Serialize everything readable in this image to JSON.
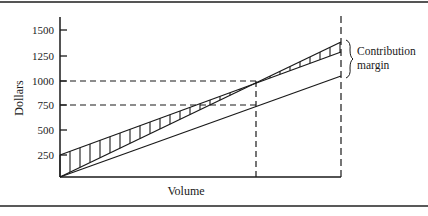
{
  "chart_data": {
    "type": "line",
    "title": "",
    "xlabel": "Volume",
    "ylabel": "Dollars",
    "y_ticks": [
      250,
      500,
      750,
      1000,
      1250,
      1500
    ],
    "y_tick_labels": [
      "250",
      "500",
      "750",
      "1000",
      "1250",
      "1500"
    ],
    "ylim": [
      0,
      1625
    ],
    "xlim": [
      0,
      1
    ],
    "grid": false,
    "legend": "none",
    "series": [
      {
        "name": "Total revenue",
        "style": "solid",
        "points": [
          [
            0,
            0
          ],
          [
            1,
            1400
          ]
        ]
      },
      {
        "name": "Total cost",
        "style": "solid",
        "points": [
          [
            0,
            250
          ],
          [
            1,
            1300
          ]
        ]
      },
      {
        "name": "Variable cost",
        "style": "solid",
        "points": [
          [
            0,
            0
          ],
          [
            1,
            1050
          ]
        ]
      }
    ],
    "shaded_region": {
      "between": [
        "Total revenue",
        "Variable cost"
      ],
      "pattern": "vertical hatching",
      "meaning": "Contribution margin"
    },
    "reference_lines": [
      {
        "type": "horizontal",
        "y": 1000,
        "style": "dashed",
        "x_to": 0.7
      },
      {
        "type": "horizontal",
        "y": 750,
        "style": "dashed",
        "x_to": 0.7
      },
      {
        "type": "vertical",
        "x": 0.7,
        "style": "dashed",
        "label": "break-even volume"
      },
      {
        "type": "vertical",
        "x": 1.0,
        "style": "dashed"
      }
    ],
    "annotations": [
      {
        "text": "Contribution margin",
        "lines": [
          "Contribution",
          "margin"
        ],
        "at_x": 1.0,
        "brace_between_y": [
          1300,
          1400
        ]
      }
    ]
  },
  "labels": {
    "y_axis": "Dollars",
    "x_axis": "Volume",
    "annotation_line1": "Contribution",
    "annotation_line2": "margin",
    "ticks": [
      "1500",
      "1250",
      "1000",
      "750",
      "500",
      "250"
    ]
  }
}
